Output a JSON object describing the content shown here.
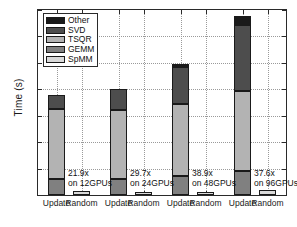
{
  "chart_data": {
    "type": "bar",
    "subtype": "stacked-bar",
    "title": "",
    "xlabel": "",
    "ylabel": "Time (s)",
    "ylim": [
      0,
      14
    ],
    "yticks": [
      0,
      2,
      4,
      6,
      8,
      10,
      12,
      14
    ],
    "ytick_labels": [
      "0",
      "2",
      "4",
      "6",
      "8",
      "10",
      "12",
      "14"
    ],
    "grid": true,
    "legend_position": "upper-left",
    "legend_entries": [
      "Other",
      "SVD",
      "TSQR",
      "GEMM",
      "SpMM"
    ],
    "series_colors": {
      "Other": "#1a1a1a",
      "SVD": "#4d4d4d",
      "TSQR": "#b3b3b3",
      "GEMM": "#808080",
      "SpMM": "#d9d9d9"
    },
    "categories": [
      "Update",
      "Random",
      "Update",
      "Random",
      "Update",
      "Random",
      "Update",
      "Random"
    ],
    "groups": [
      {
        "gpus": "12GPUs",
        "speedup": "21.9x",
        "annotation_line1": "21.9x",
        "annotation_line2": "on 12GPUs",
        "update_bar": {
          "label": "Update",
          "total": 7.55,
          "segments": [
            {
              "name": "GEMM",
              "value": 1.2,
              "y0": 0.0,
              "y1": 1.2
            },
            {
              "name": "TSQR",
              "value": 5.3,
              "y0": 1.2,
              "y1": 6.5
            },
            {
              "name": "SVD",
              "value": 1.05,
              "y0": 6.5,
              "y1": 7.55
            }
          ]
        },
        "random_bar": {
          "label": "Random",
          "total": 0.34,
          "segments": [
            {
              "name": "SpMM",
              "value": 0.34,
              "y0": 0.0,
              "y1": 0.34
            }
          ]
        }
      },
      {
        "gpus": "24GPUs",
        "speedup": "29.7x",
        "annotation_line1": "29.7x",
        "annotation_line2": "on 24GPUs",
        "update_bar": {
          "label": "Update",
          "total": 8.05,
          "segments": [
            {
              "name": "GEMM",
              "value": 1.2,
              "y0": 0.0,
              "y1": 1.2
            },
            {
              "name": "TSQR",
              "value": 5.2,
              "y0": 1.2,
              "y1": 6.4
            },
            {
              "name": "SVD",
              "value": 1.65,
              "y0": 6.4,
              "y1": 8.05
            }
          ]
        },
        "random_bar": {
          "label": "Random",
          "total": 0.26,
          "segments": [
            {
              "name": "SpMM",
              "value": 0.26,
              "y0": 0.0,
              "y1": 0.26
            }
          ]
        }
      },
      {
        "gpus": "48GPUs",
        "speedup": "38.9x",
        "annotation_line1": "38.9x",
        "annotation_line2": "on 48GPUs",
        "update_bar": {
          "label": "Update",
          "total": 9.9,
          "segments": [
            {
              "name": "GEMM",
              "value": 1.45,
              "y0": 0.0,
              "y1": 1.45
            },
            {
              "name": "TSQR",
              "value": 5.4,
              "y0": 1.45,
              "y1": 6.85
            },
            {
              "name": "SVD",
              "value": 2.85,
              "y0": 6.85,
              "y1": 9.7
            },
            {
              "name": "Other",
              "value": 0.2,
              "y0": 9.7,
              "y1": 9.9
            }
          ]
        },
        "random_bar": {
          "label": "Random",
          "total": 0.26,
          "segments": [
            {
              "name": "SpMM",
              "value": 0.26,
              "y0": 0.0,
              "y1": 0.26
            }
          ]
        }
      },
      {
        "gpus": "96GPUs",
        "speedup": "37.6x",
        "annotation_line1": "37.6x",
        "annotation_line2": "on 96GPUs",
        "update_bar": {
          "label": "Update",
          "total": 13.55,
          "segments": [
            {
              "name": "GEMM",
              "value": 1.85,
              "y0": 0.0,
              "y1": 1.85
            },
            {
              "name": "TSQR",
              "value": 6.0,
              "y0": 1.85,
              "y1": 7.85
            },
            {
              "name": "SVD",
              "value": 5.05,
              "y0": 7.85,
              "y1": 12.9
            },
            {
              "name": "Other",
              "value": 0.65,
              "y0": 12.9,
              "y1": 13.55
            }
          ]
        },
        "random_bar": {
          "label": "Random",
          "total": 0.36,
          "segments": [
            {
              "name": "SpMM",
              "value": 0.36,
              "y0": 0.0,
              "y1": 0.36
            }
          ]
        }
      }
    ]
  },
  "axis": {
    "ylabel": "Time (s)",
    "ytick_labels": [
      "0",
      "2",
      "4",
      "6",
      "8",
      "10",
      "12",
      "14"
    ],
    "xtick_labels": [
      "Update",
      "Random",
      "Update",
      "Random",
      "Update",
      "Random",
      "Update",
      "Random"
    ]
  },
  "legend": {
    "items": [
      {
        "label": "Other",
        "color": "#1a1a1a"
      },
      {
        "label": "SVD",
        "color": "#4d4d4d"
      },
      {
        "label": "TSQR",
        "color": "#b3b3b3"
      },
      {
        "label": "GEMM",
        "color": "#808080"
      },
      {
        "label": "SpMM",
        "color": "#d9d9d9"
      }
    ]
  },
  "annotations": [
    {
      "line1": "21.9x",
      "line2": "on 12GPUs"
    },
    {
      "line1": "29.7x",
      "line2": "on 24GPUs"
    },
    {
      "line1": "38.9x",
      "line2": "on 48GPUs"
    },
    {
      "line1": "37.6x",
      "line2": "on 96GPUs"
    }
  ]
}
